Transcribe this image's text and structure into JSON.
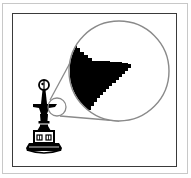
{
  "figure": {
    "description": "Raster magnification illustration: an ornamental finial with a small circled region magnified into a large circle revealing pixelated (stair-stepped) edges",
    "colors": {
      "outer_border": "#c8c8c8",
      "inner_border": "#3a3a3a",
      "magnifier_line": "#8a8a8a",
      "ink": "#000000",
      "background": "#ffffff"
    },
    "small_circle": {
      "cx": 57,
      "cy": 107,
      "r": 9
    },
    "large_circle": {
      "cx": 119,
      "cy": 71,
      "r": 50
    }
  }
}
